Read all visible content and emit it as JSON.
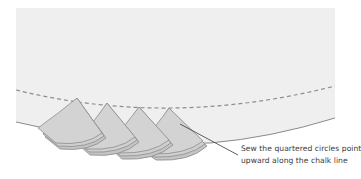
{
  "diagram": {
    "caption": {
      "line1": "Sew the quartered circles point",
      "line2": "upward along the chalk line"
    },
    "colors": {
      "fabric": "#efefef",
      "fabric_edge": "#8a8a8a",
      "chalk_line": "#8e8e8e",
      "piece_fill": "#cfcfcf",
      "piece_edge": "#8c8c8c",
      "leader_line": "#3a3a3a",
      "text": "#3a3a3a"
    },
    "pieces_count": 4
  }
}
